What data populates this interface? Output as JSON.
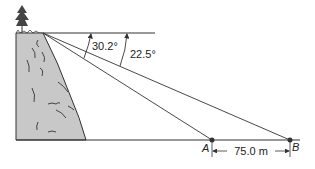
{
  "diagram": {
    "type": "angle-of-depression",
    "angles": [
      {
        "label": "30.2°",
        "target": "A"
      },
      {
        "label": "22.5°",
        "target": "B"
      }
    ],
    "points": [
      {
        "label": "A"
      },
      {
        "label": "B"
      }
    ],
    "distance_label": "75.0 m",
    "colors": {
      "line": "#333333",
      "cliff_fill": "#c8c8c8",
      "point": "#333333"
    }
  }
}
